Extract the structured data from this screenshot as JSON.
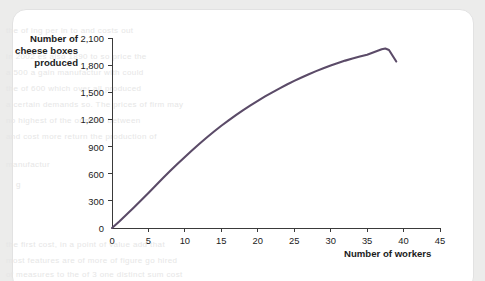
{
  "page": {
    "background_color": "#ececeb",
    "card_color": "#ffffff",
    "ghost_text_lines": [
      "the of ing per in to and costs out",
      "in 2002 es also 1890 to so price the",
      "a 500 a gain manufactur with could",
      "the of 600 which over all produced",
      "a certain demands so. The prices of firm may",
      "no highest of the or more between",
      "and cost more return the production of",
      "manufactur",
      "g",
      "the first cost, in a point of value add that",
      "most features are of more of figure go hired",
      "of measures to the of 3 one distinct sum cost"
    ]
  },
  "chart_data": {
    "type": "line",
    "title": "",
    "ylabel": "Number of cheese boxes produced",
    "xlabel": "Number of workers",
    "xlim": [
      0,
      45
    ],
    "ylim": [
      0,
      2100
    ],
    "grid": false,
    "legend": null,
    "line_color": "#5b4b68",
    "line_width": 2.1,
    "x_ticks": [
      0,
      5,
      10,
      15,
      20,
      25,
      30,
      35,
      40,
      45
    ],
    "x_tick_labels": [
      "0",
      "5",
      "10",
      "15",
      "20",
      "25",
      "30",
      "35",
      "40",
      "45"
    ],
    "y_ticks": [
      0,
      300,
      600,
      900,
      1200,
      1500,
      1800,
      2100
    ],
    "y_tick_labels": [
      "0",
      "300",
      "600",
      "900",
      "1,200",
      "1,500",
      "1,800",
      "2,100"
    ],
    "series": [
      {
        "name": "Total product",
        "x": [
          0,
          1,
          2,
          3,
          4,
          5,
          6,
          7,
          8,
          9,
          10,
          11,
          12,
          13,
          14,
          15,
          16,
          17,
          18,
          19,
          20,
          21,
          22,
          23,
          24,
          25,
          26,
          27,
          28,
          29,
          30,
          31,
          32,
          33,
          34,
          35,
          36,
          37,
          37.5,
          38,
          39
        ],
        "y": [
          0,
          72,
          148,
          226,
          306,
          388,
          470,
          552,
          632,
          710,
          786,
          860,
          932,
          1000,
          1066,
          1130,
          1190,
          1248,
          1304,
          1356,
          1406,
          1454,
          1500,
          1544,
          1586,
          1626,
          1664,
          1700,
          1734,
          1766,
          1796,
          1824,
          1850,
          1874,
          1896,
          1916,
          1946,
          1976,
          1984,
          1968,
          1840
        ]
      }
    ],
    "annotations": [
      {
        "text": "Total product curve rises, peaks near 37-38 workers, then falls",
        "visible": false
      }
    ]
  },
  "y_axis_title_lines": [
    "Number of",
    "cheese boxes",
    "produced"
  ]
}
